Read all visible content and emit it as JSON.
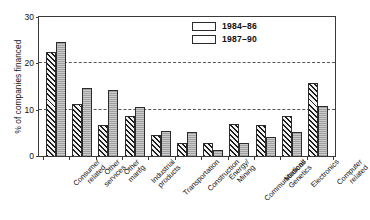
{
  "chart_data": {
    "type": "bar",
    "title": "",
    "xlabel": "",
    "ylabel": "% of companies financed",
    "ylim": [
      0,
      30
    ],
    "yticks": [
      0,
      10,
      20,
      30
    ],
    "gridlines": [
      10,
      20
    ],
    "grid": true,
    "legend_position": "top-right",
    "categories": [
      "Consumer related",
      "Other services",
      "Other manfg",
      "Industrial products",
      "Transportation",
      "Construction",
      "Energy/ Mining",
      "Communications",
      "Medical/ Genetics",
      "Electronics",
      "Computer related"
    ],
    "series": [
      {
        "name": "1984–86",
        "values": [
          22.2,
          11.1,
          6.6,
          8.5,
          4.5,
          2.8,
          2.8,
          6.8,
          6.5,
          8.6,
          15.5
        ]
      },
      {
        "name": "1987–90",
        "values": [
          24.2,
          14.5,
          14.1,
          10.5,
          5.3,
          5.2,
          1.2,
          2.8,
          4.0,
          5.2,
          10.7
        ]
      }
    ]
  },
  "legend": {
    "items": [
      {
        "label": "1984–86",
        "swatch": "diagonal-hatch-swatch"
      },
      {
        "label": "1987–90",
        "swatch": "solid-gray-swatch"
      }
    ]
  },
  "axis": {
    "y_title": "% of companies financed",
    "y_ticks": [
      "0",
      "10",
      "20",
      "30"
    ]
  },
  "colors": {
    "series_1984_86": "#1d1d1d",
    "series_1987_90": "#b9b9b9",
    "axis": "#3a3a3a",
    "gridline": "#555555",
    "background": "#ffffff"
  }
}
